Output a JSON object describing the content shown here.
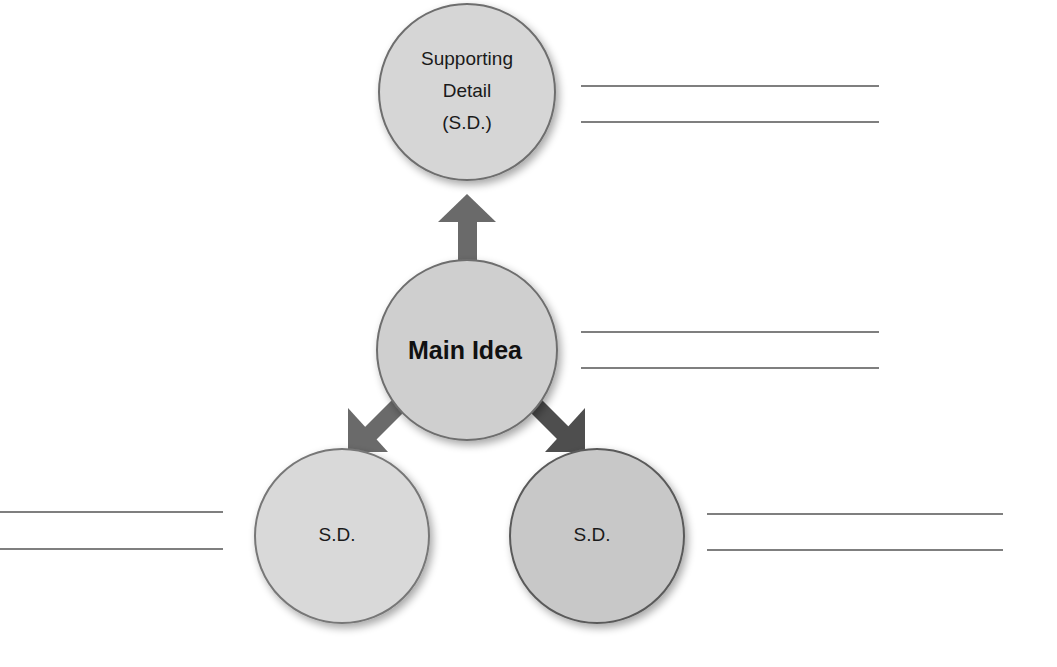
{
  "diagram": {
    "type": "main-idea-supporting-details-web",
    "colors": {
      "circle_fill": "#cfcfcf",
      "circle_fill_light": "#d6d6d6",
      "circle_fill_right": "#c8c8c8",
      "circle_stroke": "#6e6e6e",
      "arrow": "#6a6a6a",
      "arrow_dark": "#4e4e4e",
      "line": "#555555"
    },
    "nodes": {
      "top": {
        "line1": "Supporting",
        "line2": "Detail",
        "line3": "(S.D.)"
      },
      "main": {
        "label": "Main Idea"
      },
      "bottom_left": {
        "label": "S.D."
      },
      "bottom_right": {
        "label": "S.D."
      }
    },
    "answer_lines": {
      "top_right": 2,
      "main_right": 2,
      "bottom_left_left": 2,
      "bottom_right_right": 2
    }
  }
}
